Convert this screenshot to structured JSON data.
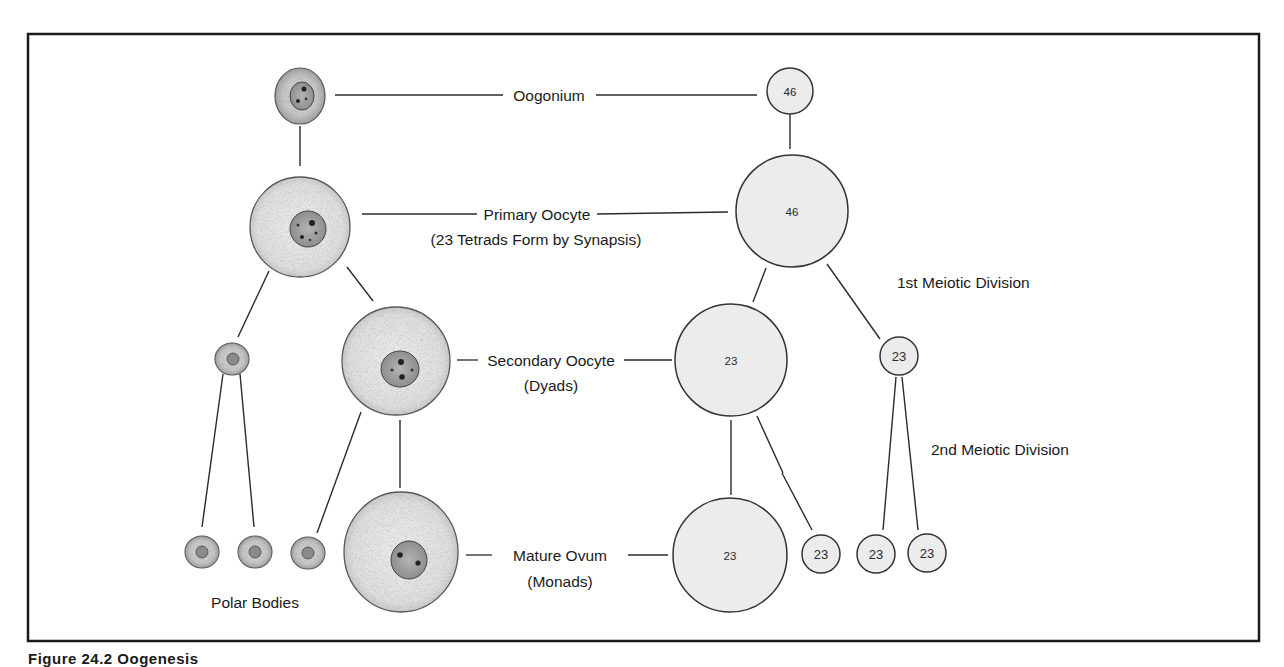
{
  "figure": {
    "caption": "Figure 24.2  Oogenesis",
    "colors": {
      "frame": "#1a1a1a",
      "line": "#2b2b2b",
      "cell_fill": "#e4e4e4",
      "cell_stipple": "#9a9a9a",
      "nucleus_fill": "#a8a8a8",
      "chromosome_circle_fill": "#ececec",
      "text": "#1a1a1a"
    }
  },
  "stages": {
    "oogonium": {
      "label": "Oogonium",
      "chromosomes": "46"
    },
    "primary_oocyte": {
      "label": "Primary Oocyte",
      "sublabel": "(23 Tetrads Form by Synapsis)",
      "chromosomes": "46"
    },
    "secondary_oocyte": {
      "label": "Secondary Oocyte",
      "sublabel": "(Dyads)",
      "chromosomes": "23"
    },
    "mature_ovum": {
      "label": "Mature Ovum",
      "sublabel": "(Monads)",
      "chromosomes": "23"
    }
  },
  "divisions": {
    "first": "1st Meiotic Division",
    "second": "2nd Meiotic Division"
  },
  "polar_bodies": {
    "label": "Polar Bodies",
    "first_polar_body_chromosomes": "23",
    "second_generation_chromosomes": [
      "23",
      "23",
      "23"
    ]
  }
}
